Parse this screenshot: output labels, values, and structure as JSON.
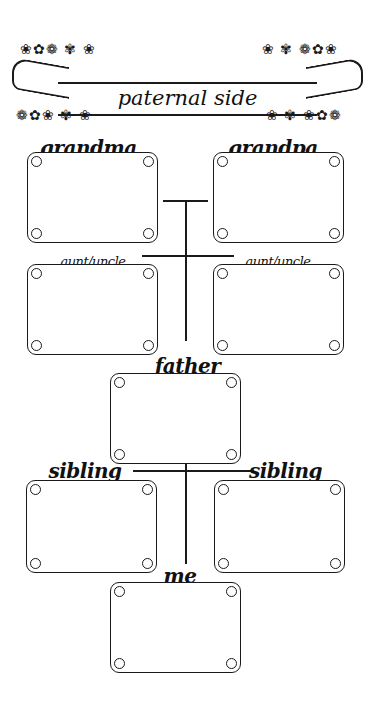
{
  "header": {
    "title": "paternal side"
  },
  "boxes": {
    "grandma": {
      "label": "grandma"
    },
    "grandpa": {
      "label": "grandpa"
    },
    "aunt_uncle_left": {
      "label": "aunt/uncle"
    },
    "aunt_uncle_right": {
      "label": "aunt/uncle"
    },
    "father": {
      "label": "father"
    },
    "sibling_left": {
      "label": "sibling"
    },
    "sibling_right": {
      "label": "sibling"
    },
    "me": {
      "label": "me"
    }
  },
  "decor": {
    "flourish_left_top": "❀✿❁ ✾ ❀",
    "flourish_left_bottom": "❁✿❀ ✾ ❀",
    "flourish_right_top": "❀ ✾ ❁✿❀",
    "flourish_right_bottom": "❀ ✾ ❀✿❁"
  },
  "colors": {
    "ink": "#1a1a1a",
    "paper": "#ffffff"
  }
}
